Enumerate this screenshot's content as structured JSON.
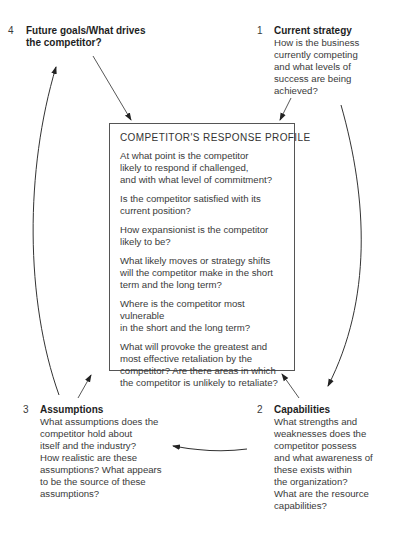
{
  "diagram": {
    "center": {
      "title": "COMPETITOR'S RESPONSE PROFILE",
      "questions": [
        "At what point is the competitor\nlikely to respond if challenged,\nand with what level of commitment?",
        "Is the competitor satisfied with its\ncurrent position?",
        "How expansionist is the competitor\nlikely to be?",
        "What likely moves or strategy shifts\nwill the competitor make in the short\nterm and the long term?",
        "Where is the competitor most vulnerable\nin the short and the long term?",
        "What will provoke the greatest and\nmost effective retaliation by the\ncompetitor? Are there areas in which\nthe competitor is unlikely to retaliate?"
      ]
    },
    "nodes": {
      "current_strategy": {
        "number": "1",
        "title": "Current strategy",
        "description": "How is the business\ncurrently competing\nand what levels of\nsuccess are being\nachieved?"
      },
      "capabilities": {
        "number": "2",
        "title": "Capabilities",
        "description": "What strengths and\nweaknesses does the\ncompetitor possess\nand what awareness of\nthese exists within\nthe organization?\nWhat are the resource\ncapabilities?"
      },
      "assumptions": {
        "number": "3",
        "title": "Assumptions",
        "description": "What assumptions does the\ncompetitor hold about\nitself and the industry?\nHow realistic are these\nassumptions? What appears\nto be the source of these\nassumptions?"
      },
      "future_goals": {
        "number": "4",
        "title": "Future goals/What drives\nthe competitor?",
        "description": ""
      }
    },
    "colors": {
      "background": "#ffffff",
      "text": "#3a3a3a",
      "lines": "#333333"
    }
  }
}
